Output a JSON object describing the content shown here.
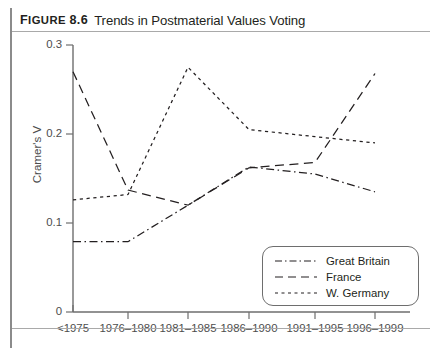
{
  "figure": {
    "label_prefix": "F",
    "label": "IGURE",
    "number": "8.6",
    "title": "Trends in Postmaterial Values Voting"
  },
  "chart_data": {
    "type": "line",
    "title": "Trends in Postmaterial Values Voting",
    "xlabel": "",
    "ylabel": "Cramer's V",
    "categories": [
      "<1975",
      "1976–1980",
      "1981–1985",
      "1986–1990",
      "1991–1995",
      "1996–1999"
    ],
    "ylim": [
      0,
      0.3
    ],
    "yticks": [
      "0",
      "0.1",
      "0.2",
      "0.3"
    ],
    "ytick_values": [
      0,
      0.1,
      0.2,
      0.3
    ],
    "grid": false,
    "legend_position": "bottom-right",
    "series": [
      {
        "name": "Great Britain",
        "style": "dash-dot",
        "values": [
          0.079,
          0.079,
          0.12,
          0.163,
          0.155,
          0.135
        ]
      },
      {
        "name": "France",
        "style": "long-dash",
        "values": [
          0.27,
          0.137,
          0.12,
          0.162,
          0.168,
          0.268
        ]
      },
      {
        "name": "W. Germany",
        "style": "short-dash",
        "values": [
          0.126,
          0.132,
          0.275,
          0.205,
          0.197,
          0.19
        ]
      }
    ]
  },
  "legend": {
    "items": [
      {
        "label": "Great Britain",
        "style": "dash-dot"
      },
      {
        "label": "France",
        "style": "long-dash"
      },
      {
        "label": "W. Germany",
        "style": "short-dash"
      }
    ]
  },
  "axis": {
    "y_label": "Cramer's V",
    "y_ticks": [
      "0.3",
      "0.2",
      "0.1",
      "0"
    ],
    "x_ticks": [
      "<1975",
      "1976–1980",
      "1981–1985",
      "1986–1990",
      "1991–1995",
      "1996–1999"
    ]
  }
}
